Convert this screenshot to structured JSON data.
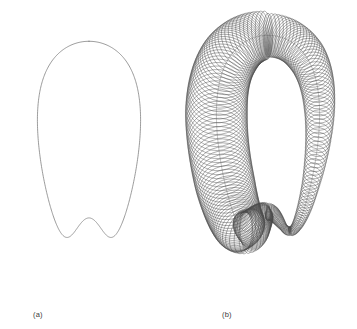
{
  "figure": {
    "background_color": "#ffffff",
    "stroke_color": "#7a7a7a",
    "stroke_color_dense": "#4a4a4a",
    "stroke_width": 0.6,
    "width": 357,
    "height": 329
  },
  "panels": [
    {
      "id": "a",
      "caption": "(a)",
      "content": "profile-curve",
      "description": "Single pear / figure-eight profile curve with a self-crossing neck near the top; the two upper arms flare outward and the lower body forms a wide rounded drop.",
      "center_x": 89,
      "bounds": {
        "x_min": 14,
        "x_max": 166,
        "y_min": 18,
        "y_max": 296
      }
    },
    {
      "id": "b",
      "caption": "(b)",
      "content": "canal-surface",
      "description": "Canal surface: family of circles swept along the same profile curve, radius small at the neck and large at the top arms and bottom body.",
      "center_x": 268,
      "bounds": {
        "x_min": 192,
        "x_max": 345,
        "y_min": 8,
        "y_max": 293
      },
      "circle_count": 220
    }
  ],
  "chart_data": {
    "type": "line",
    "xlabel": "",
    "ylabel": "",
    "grid": false,
    "legend": null,
    "series": [
      {
        "name": "profile-curve-outer",
        "comment": "Outer branch of the pear profile, sampled as (x,y) in panel-local pixels",
        "points": [
          [
            63,
            18
          ],
          [
            68,
            24
          ],
          [
            74,
            33
          ],
          [
            80,
            45
          ],
          [
            85,
            60
          ],
          [
            88,
            76
          ],
          [
            89,
            92
          ],
          [
            88,
            106
          ],
          [
            85,
            118
          ],
          [
            80,
            130
          ],
          [
            72,
            144
          ],
          [
            62,
            158
          ],
          [
            52,
            172
          ],
          [
            42,
            188
          ],
          [
            34,
            204
          ],
          [
            28,
            220
          ],
          [
            25,
            236
          ],
          [
            25,
            250
          ],
          [
            28,
            262
          ],
          [
            34,
            273
          ],
          [
            44,
            283
          ],
          [
            57,
            290
          ],
          [
            72,
            294
          ],
          [
            89,
            296
          ],
          [
            106,
            294
          ],
          [
            121,
            290
          ],
          [
            134,
            283
          ],
          [
            144,
            273
          ],
          [
            150,
            262
          ],
          [
            153,
            250
          ],
          [
            153,
            236
          ],
          [
            150,
            220
          ],
          [
            144,
            204
          ],
          [
            136,
            188
          ],
          [
            126,
            172
          ],
          [
            116,
            158
          ],
          [
            106,
            144
          ],
          [
            98,
            130
          ],
          [
            93,
            118
          ],
          [
            90,
            106
          ],
          [
            89,
            92
          ],
          [
            90,
            76
          ],
          [
            93,
            60
          ],
          [
            98,
            45
          ],
          [
            104,
            33
          ],
          [
            110,
            24
          ],
          [
            115,
            18
          ]
        ]
      },
      {
        "name": "profile-curve-inner",
        "comment": "Inner branch forming the V at the neck and the inner drop outline",
        "points": [
          [
            49,
            30
          ],
          [
            56,
            40
          ],
          [
            63,
            52
          ],
          [
            70,
            66
          ],
          [
            76,
            80
          ],
          [
            81,
            93
          ],
          [
            85,
            103
          ],
          [
            89,
            112
          ],
          [
            93,
            103
          ],
          [
            97,
            93
          ],
          [
            102,
            80
          ],
          [
            108,
            66
          ],
          [
            115,
            52
          ],
          [
            122,
            40
          ],
          [
            129,
            30
          ]
        ]
      }
    ],
    "radius_profile": {
      "comment": "Canal-surface circle radius along the arc-length parameter t in [0,1]",
      "t": [
        0.0,
        0.08,
        0.16,
        0.24,
        0.32,
        0.4,
        0.5,
        0.6,
        0.68,
        0.76,
        0.84,
        0.92,
        1.0
      ],
      "r": [
        22,
        20,
        15,
        9,
        5,
        4,
        9,
        18,
        26,
        30,
        31,
        29,
        24
      ]
    }
  }
}
